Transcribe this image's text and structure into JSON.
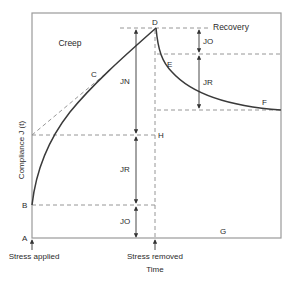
{
  "diagram": {
    "axis": {
      "ylabel": "Compliance J (t)",
      "xlabel": "Time"
    },
    "regions": {
      "creep": "Creep",
      "recovery": "Recovery"
    },
    "points": {
      "A": "A",
      "B": "B",
      "C": "C",
      "D": "D",
      "E": "E",
      "F": "F",
      "G": "G",
      "H": "H"
    },
    "components": {
      "jn": "JN",
      "jr_creep": "JR",
      "jo_creep": "JO",
      "jo_recovery": "JO",
      "jr_recovery": "JR"
    },
    "events": {
      "stress_applied": "Stress applied",
      "stress_removed": "Stress removed"
    },
    "colors": {
      "frame": "#9a9a9a",
      "curve": "#3a3a3a",
      "dashed": "#8a8a8a",
      "text": "#2a2a2a"
    }
  }
}
